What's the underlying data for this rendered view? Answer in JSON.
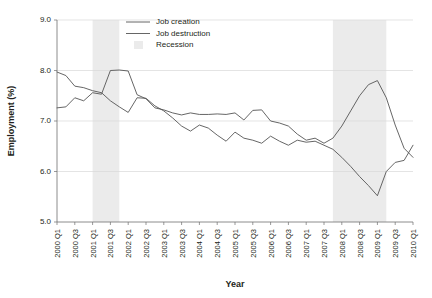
{
  "chart_data": {
    "type": "line",
    "title": "",
    "xlabel": "Year",
    "ylabel": "Employment (%)",
    "ylim": [
      5.0,
      9.0
    ],
    "yticks": [
      "5.0",
      "6.0",
      "7.0",
      "8.0",
      "9.0"
    ],
    "grid": true,
    "legend_position": "top-center",
    "x": [
      "2000 Q1",
      "2000 Q2",
      "2000 Q3",
      "2000 Q4",
      "2001 Q1",
      "2001 Q2",
      "2001 Q3",
      "2001 Q4",
      "2002 Q1",
      "2002 Q2",
      "2002 Q3",
      "2002 Q4",
      "2003 Q1",
      "2003 Q2",
      "2003 Q3",
      "2003 Q4",
      "2004 Q1",
      "2004 Q2",
      "2004 Q3",
      "2004 Q4",
      "2005 Q1",
      "2005 Q2",
      "2005 Q3",
      "2005 Q4",
      "2006 Q1",
      "2006 Q2",
      "2006 Q3",
      "2006 Q4",
      "2007 Q1",
      "2007 Q2",
      "2007 Q3",
      "2007 Q4",
      "2008 Q1",
      "2008 Q2",
      "2008 Q3",
      "2008 Q4",
      "2009 Q1",
      "2009 Q2",
      "2009 Q3",
      "2009 Q4",
      "2010 Q1"
    ],
    "xtick_labels": [
      "2000 Q1",
      "2000 Q3",
      "2001 Q1",
      "2001 Q3",
      "2002 Q1",
      "2002 Q3",
      "2003 Q1",
      "2003 Q3",
      "2004 Q1",
      "2004 Q3",
      "2005 Q1",
      "2005 Q3",
      "2006 Q1",
      "2006 Q3",
      "2007 Q1",
      "2007 Q3",
      "2008 Q1",
      "2008 Q3",
      "2009 Q1",
      "2009 Q3",
      "2010 Q1"
    ],
    "series": [
      {
        "name": "Job creation",
        "color": "#555555",
        "values": [
          7.97,
          7.9,
          7.69,
          7.66,
          7.6,
          7.56,
          7.4,
          7.28,
          7.17,
          7.46,
          7.45,
          7.3,
          7.2,
          7.06,
          6.9,
          6.8,
          6.92,
          6.86,
          6.72,
          6.6,
          6.78,
          6.66,
          6.62,
          6.56,
          6.7,
          6.6,
          6.52,
          6.62,
          6.58,
          6.6,
          6.52,
          6.44,
          6.28,
          6.1,
          5.9,
          5.72,
          5.52,
          6.0,
          6.18,
          6.22,
          6.52
        ]
      },
      {
        "name": "Job destruction",
        "color": "#555555",
        "values": [
          7.26,
          7.28,
          7.46,
          7.4,
          7.56,
          7.53,
          8.0,
          8.01,
          7.99,
          7.52,
          7.44,
          7.26,
          7.22,
          7.16,
          7.12,
          7.16,
          7.13,
          7.13,
          7.14,
          7.13,
          7.16,
          7.02,
          7.21,
          7.22,
          7.0,
          6.96,
          6.9,
          6.74,
          6.62,
          6.66,
          6.56,
          6.66,
          6.9,
          7.2,
          7.5,
          7.72,
          7.8,
          7.46,
          6.92,
          6.46,
          6.28
        ]
      }
    ],
    "recessions": [
      {
        "label": "Recession",
        "start": "2001 Q1",
        "end": "2001 Q4"
      },
      {
        "label": "Recession",
        "start": "2007 Q4",
        "end": "2009 Q2"
      }
    ],
    "legend": [
      {
        "label": "Job creation",
        "marker": "line"
      },
      {
        "label": "Job destruction",
        "marker": "line"
      },
      {
        "label": "Recession",
        "marker": "band"
      }
    ]
  }
}
